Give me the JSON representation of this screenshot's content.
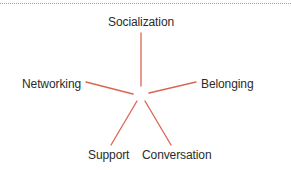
{
  "diagram": {
    "type": "radial-spoke",
    "line_color": "#d9664f",
    "rule_color": "#9a9a9a",
    "nodes": [
      {
        "id": "socialization",
        "label": "Socialization"
      },
      {
        "id": "networking",
        "label": "Networking"
      },
      {
        "id": "belonging",
        "label": "Belonging"
      },
      {
        "id": "support",
        "label": "Support"
      },
      {
        "id": "conversation",
        "label": "Conversation"
      }
    ]
  }
}
